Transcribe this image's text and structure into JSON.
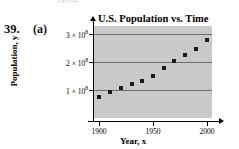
{
  "exercise": {
    "number": "39.",
    "part": "(a)",
    "top_text_remnant": "34634"
  },
  "colors": {
    "plot_background": "#c9c9c9",
    "gridline": "#6e6e6e",
    "axis": "#000000",
    "point": "#1a1a1a"
  },
  "chart_data": {
    "type": "scatter",
    "title": "U.S. Population vs. Time",
    "xlabel": "Year, x",
    "ylabel": "Population, y",
    "grid": "horizontal",
    "legend": "none",
    "xlim": [
      1895,
      2005
    ],
    "ylim": [
      0,
      330000000
    ],
    "xticks": [
      1900,
      1950,
      2000
    ],
    "xtick_labels": [
      "1900",
      "1950",
      "2000"
    ],
    "yticks": [
      100000000,
      200000000,
      300000000
    ],
    "ytick_labels": [
      "1 × 10",
      "2 × 10",
      "3 × 10"
    ],
    "ytick_exponents": [
      "8",
      "8",
      "8"
    ],
    "gridline_values": [
      100000000,
      200000000,
      300000000
    ],
    "x": [
      1900,
      1910,
      1920,
      1930,
      1940,
      1950,
      1960,
      1970,
      1980,
      1990,
      2000
    ],
    "y": [
      76000000,
      92000000,
      106000000,
      123000000,
      132000000,
      151000000,
      179000000,
      203000000,
      227000000,
      249000000,
      281000000
    ],
    "point_count": 11
  }
}
